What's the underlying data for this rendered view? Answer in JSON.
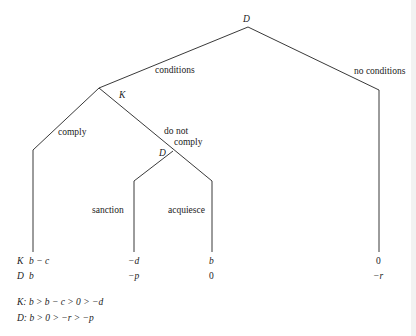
{
  "diagram": {
    "type": "game-tree",
    "nodes": {
      "root": {
        "player": "D"
      },
      "k_node": {
        "player": "K"
      },
      "d_node": {
        "player": "D"
      }
    },
    "edges": {
      "conditions": "conditions",
      "no_conditions": "no conditions",
      "comply": "comply",
      "do_not_comply_line1": "do not",
      "do_not_comply_line2": "comply",
      "sanction": "sanction",
      "acquiesce": "acquiesce"
    },
    "payoff_rows": {
      "k_label": "K",
      "d_label": "D"
    },
    "payoffs": [
      {
        "outcome": "comply",
        "K": "b − c",
        "D": "b"
      },
      {
        "outcome": "sanction",
        "K": "−d",
        "D": "−p"
      },
      {
        "outcome": "acquiesce",
        "K": "b",
        "D": "0"
      },
      {
        "outcome": "no conditions",
        "K": "0",
        "D": "−r"
      }
    ],
    "preferences": {
      "K": "K: b > b − c > 0 > −d",
      "D": "D: b > 0 > −r > −p"
    }
  }
}
